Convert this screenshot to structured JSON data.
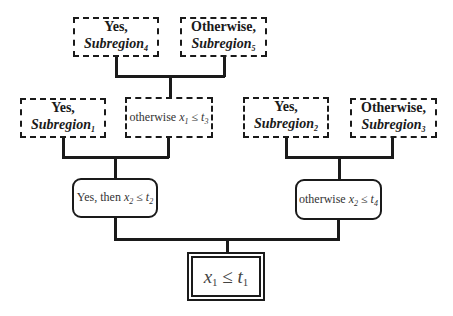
{
  "diagram": {
    "type": "decision-tree",
    "root": {
      "condition_var": "x",
      "condition_var_sub": "1",
      "op": "≤",
      "condition_thr": "t",
      "condition_thr_sub": "1"
    },
    "level1": {
      "left": {
        "prefix": "Yes, then ",
        "var": "x",
        "var_sub": "2",
        "op": "≤",
        "thr": "t",
        "thr_sub": "2"
      },
      "right": {
        "prefix": "otherwise ",
        "var": "x",
        "var_sub": "2",
        "op": "≤",
        "thr": "t",
        "thr_sub": "4"
      }
    },
    "level2": {
      "subregion1": {
        "line1": "Yes,",
        "line2": "Subregion",
        "sub": "1"
      },
      "otherwise_node": {
        "prefix": "otherwise ",
        "var": "x",
        "var_sub": "1",
        "op": "≤",
        "thr": "t",
        "thr_sub": "3"
      },
      "subregion2": {
        "line1": "Yes,",
        "line2": "Subregion",
        "sub": "2"
      },
      "subregion3": {
        "line1": "Otherwise,",
        "line2": "Subregion",
        "sub": "3"
      }
    },
    "level3": {
      "subregion4": {
        "line1": "Yes,",
        "line2": "Subregion",
        "sub": "4"
      },
      "subregion5": {
        "line1": "Otherwise,",
        "line2": "Subregion",
        "sub": "5"
      }
    }
  }
}
